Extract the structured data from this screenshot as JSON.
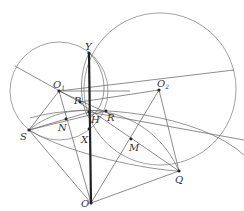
{
  "diagram": {
    "type": "geometry-figure",
    "circles": [
      {
        "name": "O1",
        "label": "circle centered at O1"
      },
      {
        "name": "O2",
        "label": "circle centered at O2"
      }
    ],
    "points": [
      {
        "id": "Y",
        "label": "Y"
      },
      {
        "id": "O1",
        "label": "O",
        "sub": "1"
      },
      {
        "id": "O2",
        "label": "O",
        "sub": "2"
      },
      {
        "id": "P",
        "label": "P"
      },
      {
        "id": "H",
        "label": "H"
      },
      {
        "id": "R",
        "label": "R"
      },
      {
        "id": "N",
        "label": "N"
      },
      {
        "id": "S",
        "label": "S"
      },
      {
        "id": "X",
        "label": "X"
      },
      {
        "id": "M",
        "label": "M"
      },
      {
        "id": "Q",
        "label": "Q"
      },
      {
        "id": "O",
        "label": "O"
      }
    ],
    "segments": [
      [
        "Y",
        "O"
      ],
      [
        "O1",
        "O2"
      ],
      [
        "O1",
        "S"
      ],
      [
        "O1",
        "R"
      ],
      [
        "O1",
        "O"
      ],
      [
        "O2",
        "Q"
      ],
      [
        "O2",
        "O"
      ],
      [
        "S",
        "O"
      ],
      [
        "Q",
        "O"
      ],
      [
        "S",
        "R"
      ],
      [
        "S",
        "H"
      ],
      [
        "S",
        "Q"
      ]
    ]
  }
}
